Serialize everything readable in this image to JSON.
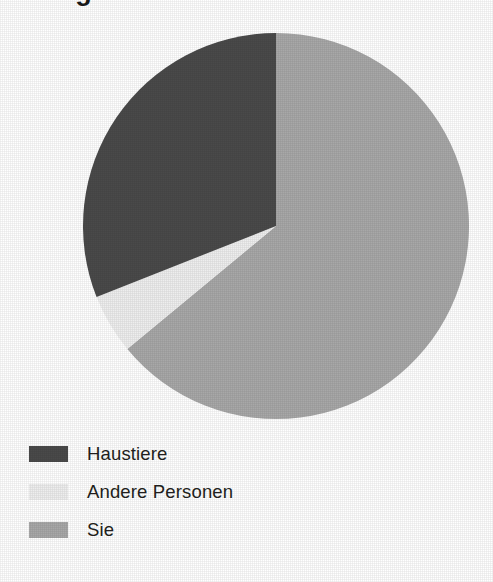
{
  "figure": {
    "title": "Wer gibt Ihnen das meiste Feedback?",
    "title_clipped": true,
    "background_color": "#ffffff"
  },
  "chart_data": {
    "type": "pie",
    "title": "Wer gibt Ihnen das meiste Feedback?",
    "xlabel": "",
    "ylabel": "",
    "grid": false,
    "legend_position": "bottom-left",
    "start_angle_deg": 0,
    "direction": "clockwise",
    "center": {
      "x": 276,
      "y": 226
    },
    "radius": 193,
    "categories": [
      "Sie",
      "Andere Personen",
      "Haustiere"
    ],
    "values": [
      64,
      5,
      31
    ],
    "value_unit": "percent",
    "colors": [
      "#a8a8a8",
      "#eeeeee",
      "#4a4a4a"
    ],
    "slices": [
      {
        "label": "Sie",
        "value": 64,
        "color": "#a8a8a8",
        "start_angle_deg": 0,
        "end_angle_deg": 230.4
      },
      {
        "label": "Andere Personen",
        "value": 5,
        "color": "#eeeeee",
        "start_angle_deg": 230.4,
        "end_angle_deg": 248.4
      },
      {
        "label": "Haustiere",
        "value": 31,
        "color": "#4a4a4a",
        "start_angle_deg": 248.4,
        "end_angle_deg": 360
      }
    ]
  },
  "legend": {
    "items": [
      {
        "label": "Haustiere",
        "color": "#4a4a4a"
      },
      {
        "label": "Andere Personen",
        "color": "#eeeeee"
      },
      {
        "label": "Sie",
        "color": "#a8a8a8"
      }
    ]
  }
}
